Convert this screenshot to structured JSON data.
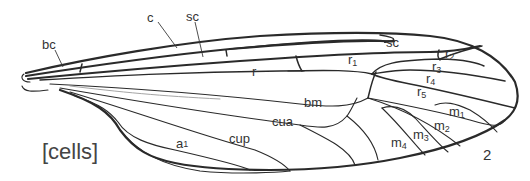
{
  "figure": {
    "title": "[cells]",
    "figure_number": "2"
  },
  "labels": {
    "bc": "bc",
    "c": "c",
    "sc_pointer": "sc",
    "sc_cell": "sc",
    "r": "r",
    "r1_base": "r",
    "r1_sub": "1",
    "r2_base": "r",
    "r2_sub": "2",
    "r3_base": "r",
    "r3_sub": "3",
    "r4_base": "r",
    "r4_sub": "4",
    "r5_base": "r",
    "r5_sub": "5",
    "bm": "bm",
    "cua": "cua",
    "cup": "cup",
    "a1_base": "a",
    "a1_sub": "1",
    "m1_base": "m",
    "m1_sub": "1",
    "m2_base": "m",
    "m2_sub": "2",
    "m3_base": "m",
    "m3_sub": "3",
    "m4_base": "m",
    "m4_sub": "4"
  },
  "colors": {
    "vein": "#2a2a2a",
    "text": "#333333",
    "background": "#ffffff"
  }
}
